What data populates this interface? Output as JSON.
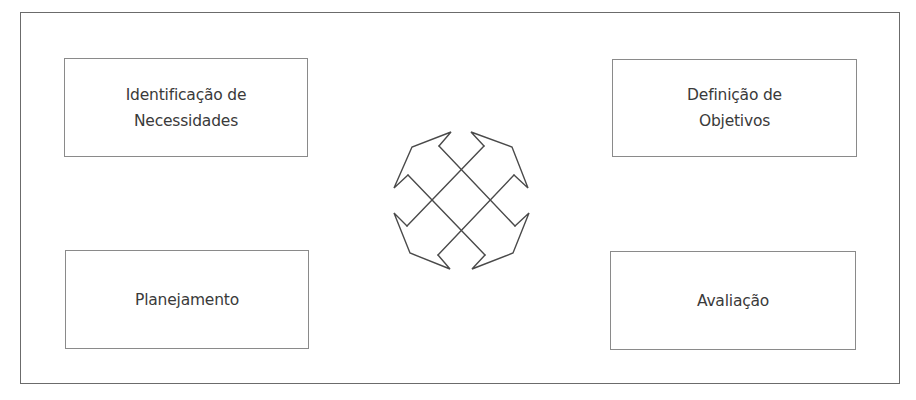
{
  "diagram": {
    "type": "cycle",
    "stages": [
      {
        "id": "tl",
        "label": "Identificação de\nNecessidades"
      },
      {
        "id": "tr",
        "label": "Definição de\nObjetivos"
      },
      {
        "id": "bl",
        "label": "Planejamento"
      },
      {
        "id": "br",
        "label": "Avaliação"
      }
    ],
    "center_icon": "four-way-diagonal-arrows-icon",
    "colors": {
      "frame_border": "#6b6b6b",
      "box_border": "#8a8a8a",
      "text": "#3a3a3a",
      "arrow_stroke": "#4a4a4a",
      "background": "#ffffff"
    }
  }
}
